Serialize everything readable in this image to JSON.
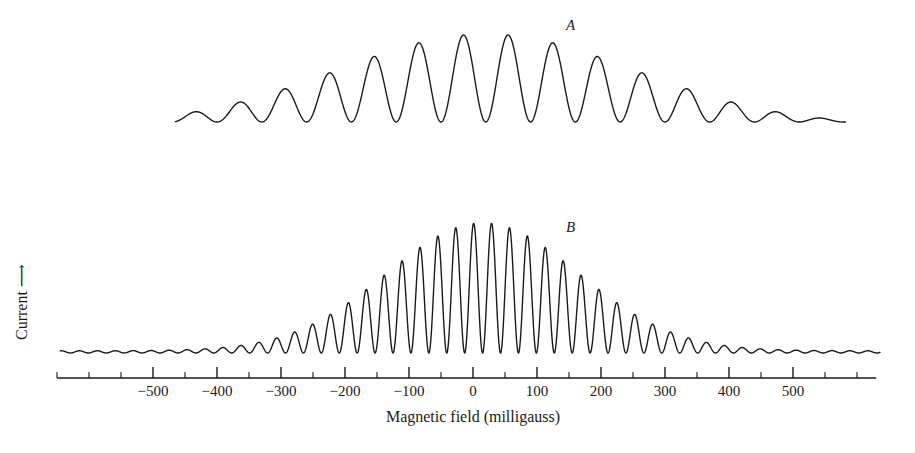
{
  "figure": {
    "width": 915,
    "height": 453,
    "background": "#ffffff",
    "stroke_color": "#1a1a1a"
  },
  "axes": {
    "x_title": "Magnetic field (milligauss)",
    "y_title": "Current",
    "y_title_arrow": "⟶",
    "x_tick_labels": [
      "−500",
      "−400",
      "−300",
      "−200",
      "−100",
      "0",
      "100",
      "200",
      "300",
      "400",
      "500"
    ],
    "x_tick_values": [
      -500,
      -400,
      -300,
      -200,
      -100,
      0,
      100,
      200,
      300,
      400,
      500
    ],
    "x_minor_step": 50,
    "x_axis_min": -650,
    "x_axis_max": 630,
    "axis_line_y": 378,
    "major_tick_length": 11,
    "minor_tick_length": 6,
    "pixels_per_100": 64,
    "x_zero_px": 473
  },
  "curves": [
    {
      "name": "A",
      "label": "A",
      "label_x": 566,
      "label_y": 18,
      "baseline_y": 122,
      "x_start": -465,
      "x_end": 582,
      "peak_amplitude": 88,
      "envelope_center": 20,
      "envelope_sigma": 232,
      "oscillation_period": 70,
      "oscillation_phase": 20,
      "line_width": 1.4
    },
    {
      "name": "B",
      "label": "B",
      "label_x": 566,
      "label_y": 220,
      "baseline_y": 353,
      "x_start": -645,
      "x_end": 636,
      "peak_amplitude": 128,
      "envelope_center": 15,
      "envelope_sigma": 150,
      "oscillation_period": 28,
      "oscillation_phase": 15,
      "ripple_floor": 2.2,
      "line_width": 1.4
    }
  ],
  "chart_data": {
    "type": "line",
    "title": "",
    "xlabel": "Magnetic field (milligauss)",
    "ylabel": "Current",
    "xlim": [
      -650,
      630
    ],
    "grid": false,
    "legend": "inline-curve-labels",
    "x_ticks": [
      -500,
      -400,
      -300,
      -200,
      -100,
      0,
      100,
      200,
      300,
      400,
      500
    ],
    "x_tick_labels": [
      "−500",
      "−400",
      "−300",
      "−200",
      "−100",
      "0",
      "100",
      "200",
      "300",
      "400",
      "500"
    ],
    "x_minor_tick_step": 50,
    "y_ticks": [],
    "y_tick_labels": [],
    "series": [
      {
        "name": "A",
        "annotation": "A",
        "description": "Oscillating current vs magnetic field, broad Gaussian envelope, long oscillation period, troughs returning to baseline",
        "x_range": [
          -465,
          582
        ],
        "envelope_center": 20,
        "envelope_sigma": 232,
        "peak_amplitude_relative": 1.0,
        "oscillation_period": 70,
        "n_visible_oscillations": 15
      },
      {
        "name": "B",
        "annotation": "B",
        "description": "Oscillating current vs magnetic field, narrower Gaussian envelope, short oscillation period (high frequency ripple), small residual ripple in wings",
        "x_range": [
          -645,
          636
        ],
        "envelope_center": 15,
        "envelope_sigma": 150,
        "peak_amplitude_relative": 1.45,
        "oscillation_period": 28,
        "n_visible_oscillations": 45
      }
    ]
  }
}
